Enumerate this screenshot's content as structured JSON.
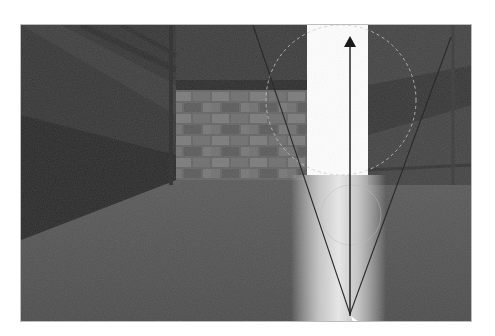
{
  "figure": {
    "colors": {
      "background": "#ffffff",
      "scene_base": "#4a4a4a",
      "left_wall_dark": "#2e2e2e",
      "ceiling": "#3a3a3a",
      "brick_wall": "#6a6a6a",
      "brick_light": "#7c7c7c",
      "floor": "#545454",
      "doorway_light": "#ffffff",
      "right_wall": "#3f3f3f",
      "arrow": "#1a1a1a",
      "cone_lines": "#2a2a2a",
      "circle_outline": "#c8c8c8"
    },
    "overlay": {
      "arrow": {
        "x": 329,
        "y_start": 291,
        "y_end": 12,
        "label": ""
      },
      "cone": {
        "apex": [
          329,
          289
        ],
        "left_end": [
          232,
          0
        ],
        "right_end": [
          430,
          12
        ]
      }
    }
  }
}
